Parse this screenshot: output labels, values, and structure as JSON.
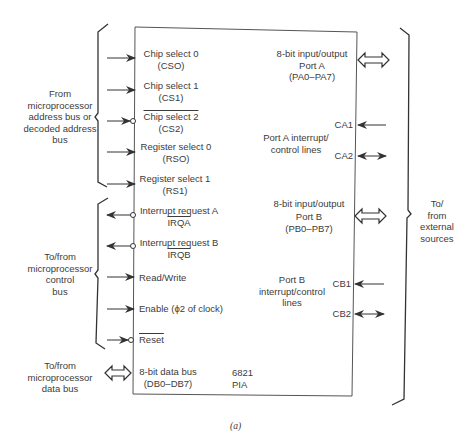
{
  "chip": {
    "name_line1": "6821",
    "name_line2": "PIA"
  },
  "left_groups": {
    "address": {
      "line1": "From",
      "line2": "microprocessor",
      "line3": "address bus or",
      "line4": "decoded address",
      "line5": "bus"
    },
    "control": {
      "line1": "To/from",
      "line2": "microprocessor",
      "line3": "control",
      "line4": "bus"
    },
    "data": {
      "line1": "To/from",
      "line2": "microprocessor",
      "line3": "data bus"
    }
  },
  "right_group": {
    "line1": "To/",
    "line2": "from",
    "line3": "external",
    "line4": "sources"
  },
  "left_pins": [
    {
      "label": "Chip select 0",
      "sub": "(CSO)",
      "direction": "in",
      "active_low": false
    },
    {
      "label": "Chip select 1",
      "sub": "(CS1)",
      "direction": "in",
      "active_low": false
    },
    {
      "label": "Chip select 2",
      "sub": "(CS2)",
      "direction": "in",
      "active_low": true
    },
    {
      "label": "Register select 0",
      "sub": "(RSO)",
      "direction": "in",
      "active_low": false
    },
    {
      "label": "Register select 1",
      "sub": "(RS1)",
      "direction": "in",
      "active_low": false
    },
    {
      "label": "Interrupt request A",
      "sub": "IRQA",
      "direction": "out",
      "active_low": true
    },
    {
      "label": "Interrupt request B",
      "sub": "IRQB",
      "direction": "out",
      "active_low": true
    },
    {
      "label": "Read/Write",
      "sub": "",
      "direction": "in",
      "active_low": false
    },
    {
      "label": "Enable (ϕ2 of clock)",
      "sub": "",
      "direction": "in",
      "active_low": false
    },
    {
      "label": "Reset",
      "sub": "",
      "direction": "in",
      "active_low": true
    },
    {
      "label": "8-bit data bus",
      "sub": "(DB0–DB7)",
      "direction": "bidirectional-bus",
      "active_low": false
    }
  ],
  "right_pins": {
    "port_a": {
      "line1": "8-bit input/output",
      "line2": "Port A",
      "line3": "(PA0–PA7)"
    },
    "port_a_ctrl": {
      "line1": "Port A interrupt/",
      "line2": "control lines",
      "ca1": "CA1",
      "ca2": "CA2"
    },
    "port_b": {
      "line1": "8-bit input/output",
      "line2": "Port B",
      "line3": "(PB0–PB7)"
    },
    "port_b_ctrl": {
      "line1": "Port B",
      "line2": "interrupt/control",
      "line3": "lines",
      "cb1": "CB1",
      "cb2": "CB2"
    }
  },
  "caption": "(a)"
}
